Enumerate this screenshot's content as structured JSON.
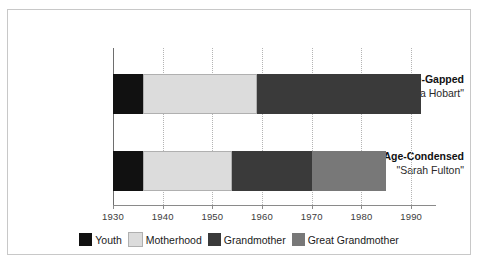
{
  "chart_data": {
    "type": "bar",
    "orientation": "horizontal",
    "stacked": true,
    "title": "",
    "xlabel": "",
    "ylabel": "",
    "xlim": [
      1930,
      1995
    ],
    "xticks": [
      1930,
      1940,
      1950,
      1960,
      1970,
      1980,
      1990
    ],
    "xtick_labels": [
      "1930",
      "1940",
      "1950",
      "1960",
      "1970",
      "1980",
      "1990"
    ],
    "grid": true,
    "legend_position": "bottom",
    "categories": [
      {
        "name": "Age-Gapped",
        "subtitle": "\"Brenda Hobart\""
      },
      {
        "name": "Age-Condensed",
        "subtitle": "\"Sarah Fulton\""
      }
    ],
    "series": [
      {
        "name": "Youth",
        "color": "#111111",
        "values": [
          6,
          6
        ]
      },
      {
        "name": "Motherhood",
        "color": "#dcdcdc",
        "values": [
          23,
          18
        ]
      },
      {
        "name": "Grandmother",
        "color": "#3a3a3a",
        "values": [
          33,
          16
        ]
      },
      {
        "name": "Great Grandmother",
        "color": "#787878",
        "values": [
          0,
          15
        ]
      }
    ],
    "spans": [
      {
        "category": "Age-Gapped",
        "segments": [
          {
            "label": "Youth",
            "start": 1930,
            "end": 1936,
            "color": "#111111"
          },
          {
            "label": "Motherhood",
            "start": 1936,
            "end": 1959,
            "color": "#dcdcdc"
          },
          {
            "label": "Grandmother",
            "start": 1959,
            "end": 1992,
            "color": "#3a3a3a"
          }
        ]
      },
      {
        "category": "Age-Condensed",
        "segments": [
          {
            "label": "Youth",
            "start": 1930,
            "end": 1936,
            "color": "#111111"
          },
          {
            "label": "Motherhood",
            "start": 1936,
            "end": 1954,
            "color": "#dcdcdc"
          },
          {
            "label": "Grandmother",
            "start": 1954,
            "end": 1970,
            "color": "#3a3a3a"
          },
          {
            "label": "Great Grandmother",
            "start": 1970,
            "end": 1985,
            "color": "#787878"
          }
        ]
      }
    ],
    "legend": [
      {
        "label": "Youth",
        "color": "#111111"
      },
      {
        "label": "Motherhood",
        "color": "#dcdcdc"
      },
      {
        "label": "Grandmother",
        "color": "#3a3a3a"
      },
      {
        "label": "Great Grandmother",
        "color": "#787878"
      }
    ]
  },
  "frame": {
    "border_color": "#c8c8c8",
    "background": "#ffffff"
  }
}
